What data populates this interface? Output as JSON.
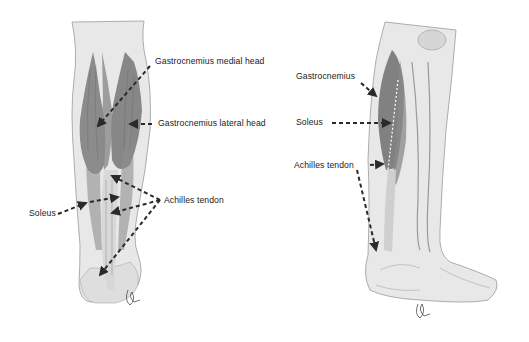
{
  "figure": {
    "colors": {
      "background": "#ffffff",
      "skin": "#e6e6e6",
      "muscle": "#6e6e6e",
      "tendon": "#cfcfcf",
      "arrow": "#2a2a2a",
      "text": "#1a1a1a"
    }
  },
  "posterior_view": {
    "labels": {
      "gastrocnemius_medial_head": "Gastrocnemius medial head",
      "gastrocnemius_lateral_head": "Gastrocnemius lateral head",
      "soleus": "Soleus",
      "achilles_tendon": "Achilles tendon"
    }
  },
  "lateral_view": {
    "labels": {
      "gastrocnemius": "Gastrocnemius",
      "soleus": "Soleus",
      "achilles_tendon": "Achilles tendon"
    }
  }
}
